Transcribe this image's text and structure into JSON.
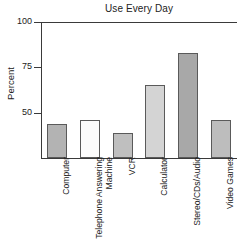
{
  "chart_data": {
    "type": "bar",
    "title": "Use Every Day",
    "xlabel": "",
    "ylabel": "Percent",
    "ylim": [
      25,
      100
    ],
    "yticks": [
      50,
      75,
      100
    ],
    "ytick_labels": [
      "50",
      "75",
      "100"
    ],
    "grid": false,
    "legend": "none",
    "axis_truncated_at_bottom": true,
    "categories": [
      "Computer",
      "Telephone Answering\nMachine",
      "VCR",
      "Calculator",
      "Stereo/CDs/Audio",
      "Video Games"
    ],
    "values": [
      44,
      46,
      39,
      65,
      83,
      46
    ],
    "bar_colors": [
      "#b3b3b3",
      "#fcfcfc",
      "#bfbfbf",
      "#d4d4d4",
      "#a8a8a8",
      "#bdbdbd"
    ],
    "bar_edge_color": "#5a5a5a"
  },
  "colors": {
    "axis": "#3a3a3a",
    "text": "#222222",
    "background": "#ffffff"
  }
}
